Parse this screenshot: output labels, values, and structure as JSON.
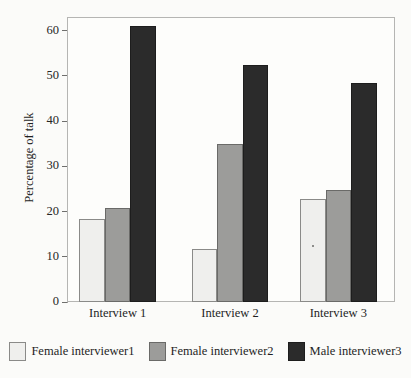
{
  "chart_data": {
    "type": "bar",
    "title": "",
    "subtitle": "",
    "xlabel": "",
    "ylabel": "Percentage of talk",
    "categories": [
      "Interview 1",
      "Interview 2",
      "Interview 3"
    ],
    "series": [
      {
        "name": "Female interviewer1",
        "color": "#efefed",
        "values": [
          18.3,
          11.8,
          22.8
        ]
      },
      {
        "name": "Female interviewer2",
        "color": "#9c9c9a",
        "values": [
          20.8,
          35.0,
          24.8
        ]
      },
      {
        "name": "Male interviewer3",
        "color": "#2b2b2b",
        "values": [
          61.0,
          52.5,
          48.5
        ]
      }
    ],
    "ylim": [
      0,
      63
    ],
    "yticks": [
      0,
      10,
      20,
      30,
      40,
      50,
      60
    ],
    "ytick_labels": [
      "0",
      "10",
      "20",
      "30",
      "40",
      "50",
      "60"
    ],
    "grid": false,
    "legend_position": "bottom",
    "bar_layout": "grouped-adjacent",
    "frame": true
  },
  "colors": {
    "series1": "#efefed",
    "series2": "#9c9c9a",
    "series3": "#2b2b2b",
    "frame": "#b5b5b3",
    "text": "#1f1f1f",
    "background": "#fbfbf9"
  }
}
